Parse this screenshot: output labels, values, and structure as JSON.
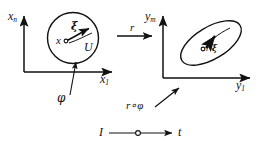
{
  "figure": {
    "type": "commutative-diagram",
    "stroke_color": "#111111",
    "background_color": "#ffffff"
  },
  "left_frame": {
    "vertical_axis_label": "x",
    "vertical_axis_sub": "n",
    "horizontal_axis_label": "x",
    "horizontal_axis_sub": "1",
    "region_shape": "circle",
    "point_label": "x",
    "vector_label": "ξ",
    "region_label": "U"
  },
  "right_frame": {
    "vertical_axis_label": "y",
    "vertical_axis_sub": "m",
    "horizontal_axis_label": "y",
    "horizontal_axis_sub": "1",
    "region_shape": "ellipse",
    "point_label": "r",
    "vector_label": "ξ",
    "vector_prefix": "r·"
  },
  "arrows": {
    "map_label": "r",
    "composition_label": "r∘φ",
    "curve_label": "φ",
    "index_start_label": "I",
    "index_end_label": "t"
  }
}
